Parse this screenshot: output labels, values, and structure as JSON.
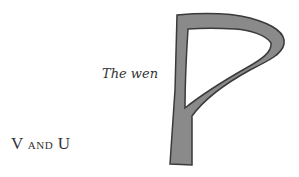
{
  "labels": {
    "wen_caption": "The wen",
    "vu_caption_cap1": "V",
    "vu_caption_mid": "and",
    "vu_caption_cap2": "U"
  },
  "glyph": {
    "name": "wynn-letter",
    "fill": "#8a8a8a",
    "stroke": "#3a3a3a"
  }
}
